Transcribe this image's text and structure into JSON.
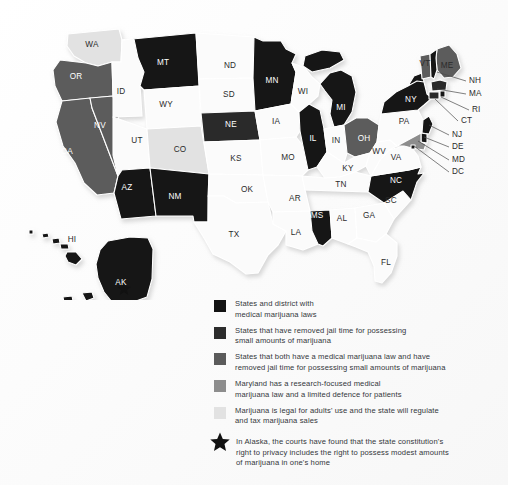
{
  "figure": {
    "background_color": "#fdfdfd",
    "title": ""
  },
  "map": {
    "name": "united-states-marijuana-laws-map",
    "projection_note": "Alaska and Hawaii shown as insets at lower left",
    "colors": {
      "medical_only": "#131313",
      "decriminalized": "#2c2c2c",
      "both_medical_and_decriminalized": "#5b5b5b",
      "maryland_research": "#8d8d8d",
      "legal_regulated": "#e2e2e2",
      "no_category": "#fbfbfb",
      "border": "#ffffff",
      "star": "#111111"
    },
    "states": [
      {
        "abbr": "WA",
        "name": "Washington",
        "category": "legal_regulated",
        "x": 92,
        "y": 45,
        "label_fill": "light"
      },
      {
        "abbr": "OR",
        "name": "Oregon",
        "category": "both_medical_and_decriminalized",
        "x": 76,
        "y": 77,
        "label_fill": "dark"
      },
      {
        "abbr": "CA",
        "name": "California",
        "category": "both_medical_and_decriminalized",
        "x": 67,
        "y": 152,
        "label_fill": "dark"
      },
      {
        "abbr": "NV",
        "name": "Nevada",
        "category": "both_medical_and_decriminalized",
        "x": 100,
        "y": 126,
        "label_fill": "dark"
      },
      {
        "abbr": "ID",
        "name": "Idaho",
        "category": "no_category",
        "x": 121,
        "y": 92,
        "label_fill": "light"
      },
      {
        "abbr": "MT",
        "name": "Montana",
        "category": "medical_only",
        "x": 163,
        "y": 63,
        "label_fill": "dark"
      },
      {
        "abbr": "WY",
        "name": "Wyoming",
        "category": "no_category",
        "x": 166,
        "y": 105,
        "label_fill": "light"
      },
      {
        "abbr": "UT",
        "name": "Utah",
        "category": "no_category",
        "x": 137,
        "y": 141,
        "label_fill": "light"
      },
      {
        "abbr": "CO",
        "name": "Colorado",
        "category": "legal_regulated",
        "x": 180,
        "y": 150,
        "label_fill": "light"
      },
      {
        "abbr": "AZ",
        "name": "Arizona",
        "category": "medical_only",
        "x": 127,
        "y": 188,
        "label_fill": "dark"
      },
      {
        "abbr": "NM",
        "name": "New Mexico",
        "category": "medical_only",
        "x": 175,
        "y": 197,
        "label_fill": "dark"
      },
      {
        "abbr": "ND",
        "name": "North Dakota",
        "category": "no_category",
        "x": 230,
        "y": 66,
        "label_fill": "light"
      },
      {
        "abbr": "SD",
        "name": "South Dakota",
        "category": "no_category",
        "x": 229,
        "y": 95,
        "label_fill": "light"
      },
      {
        "abbr": "NE",
        "name": "Nebraska",
        "category": "decriminalized",
        "x": 231,
        "y": 125,
        "label_fill": "dark"
      },
      {
        "abbr": "KS",
        "name": "Kansas",
        "category": "no_category",
        "x": 236,
        "y": 159,
        "label_fill": "light"
      },
      {
        "abbr": "OK",
        "name": "Oklahoma",
        "category": "no_category",
        "x": 247,
        "y": 190,
        "label_fill": "light"
      },
      {
        "abbr": "TX",
        "name": "Texas",
        "category": "no_category",
        "x": 234,
        "y": 235,
        "label_fill": "light"
      },
      {
        "abbr": "MN",
        "name": "Minnesota",
        "category": "medical_only",
        "x": 272,
        "y": 81,
        "label_fill": "dark"
      },
      {
        "abbr": "IA",
        "name": "Iowa",
        "category": "no_category",
        "x": 276,
        "y": 122,
        "label_fill": "light"
      },
      {
        "abbr": "MO",
        "name": "Missouri",
        "category": "no_category",
        "x": 288,
        "y": 158,
        "label_fill": "light"
      },
      {
        "abbr": "AR",
        "name": "Arkansas",
        "category": "no_category",
        "x": 295,
        "y": 199,
        "label_fill": "light"
      },
      {
        "abbr": "LA",
        "name": "Louisiana",
        "category": "no_category",
        "x": 296,
        "y": 233,
        "label_fill": "light"
      },
      {
        "abbr": "WI",
        "name": "Wisconsin",
        "category": "no_category",
        "x": 303,
        "y": 92,
        "label_fill": "light"
      },
      {
        "abbr": "IL",
        "name": "Illinois",
        "category": "medical_only",
        "x": 313,
        "y": 139,
        "label_fill": "dark"
      },
      {
        "abbr": "MS",
        "name": "Mississippi",
        "category": "medical_only",
        "x": 317,
        "y": 216,
        "label_fill": "dark"
      },
      {
        "abbr": "MI",
        "name": "Michigan",
        "category": "medical_only",
        "x": 341,
        "y": 108,
        "label_fill": "dark"
      },
      {
        "abbr": "IN",
        "name": "Indiana",
        "category": "no_category",
        "x": 336,
        "y": 141,
        "label_fill": "light"
      },
      {
        "abbr": "KY",
        "name": "Kentucky",
        "category": "no_category",
        "x": 348,
        "y": 169,
        "label_fill": "light"
      },
      {
        "abbr": "TN",
        "name": "Tennessee",
        "category": "no_category",
        "x": 341,
        "y": 185,
        "label_fill": "light"
      },
      {
        "abbr": "AL",
        "name": "Alabama",
        "category": "no_category",
        "x": 342,
        "y": 219,
        "label_fill": "light"
      },
      {
        "abbr": "OH",
        "name": "Ohio",
        "category": "both_medical_and_decriminalized",
        "x": 364,
        "y": 139,
        "label_fill": "dark"
      },
      {
        "abbr": "GA",
        "name": "Georgia",
        "category": "no_category",
        "x": 369,
        "y": 216,
        "label_fill": "light"
      },
      {
        "abbr": "FL",
        "name": "Florida",
        "category": "no_category",
        "x": 386,
        "y": 263,
        "label_fill": "light"
      },
      {
        "abbr": "SC",
        "name": "South Carolina",
        "category": "no_category",
        "x": 391,
        "y": 201,
        "label_fill": "light"
      },
      {
        "abbr": "NC",
        "name": "North Carolina",
        "category": "medical_only",
        "x": 396,
        "y": 181,
        "label_fill": "dark"
      },
      {
        "abbr": "VA",
        "name": "Virginia",
        "category": "no_category",
        "x": 396,
        "y": 158,
        "label_fill": "light"
      },
      {
        "abbr": "WV",
        "name": "West Virginia",
        "category": "no_category",
        "x": 379,
        "y": 152,
        "label_fill": "light"
      },
      {
        "abbr": "PA",
        "name": "Pennsylvania",
        "category": "no_category",
        "x": 404,
        "y": 122,
        "label_fill": "light"
      },
      {
        "abbr": "NY",
        "name": "New York",
        "category": "medical_only",
        "x": 411,
        "y": 100,
        "label_fill": "dark"
      },
      {
        "abbr": "VT",
        "name": "Vermont",
        "category": "both_medical_and_decriminalized",
        "x": 425,
        "y": 64,
        "label_fill": "light"
      },
      {
        "abbr": "ME",
        "name": "Maine",
        "category": "both_medical_and_decriminalized",
        "x": 447,
        "y": 66,
        "label_fill": "light"
      },
      {
        "abbr": "AK",
        "name": "Alaska",
        "category": "medical_only",
        "x": 121,
        "y": 283,
        "label_fill": "dark"
      },
      {
        "abbr": "HI",
        "name": "Hawaii",
        "category": "medical_only",
        "x": 72,
        "y": 240,
        "label_fill": "light"
      }
    ],
    "callouts": [
      {
        "abbr": "NH",
        "name": "New Hampshire",
        "category": "medical_only",
        "label_x": 469,
        "label_y": 81,
        "lx1": 466,
        "ly1": 81,
        "lx2": 437,
        "ly2": 72
      },
      {
        "abbr": "MA",
        "name": "Massachusetts",
        "category": "decriminalized",
        "label_x": 469,
        "label_y": 94,
        "lx1": 466,
        "ly1": 94,
        "lx2": 437,
        "ly2": 89
      },
      {
        "abbr": "RI",
        "name": "Rhode Island",
        "category": "medical_only",
        "label_x": 472,
        "label_y": 110,
        "lx1": 469,
        "ly1": 110,
        "lx2": 441,
        "ly2": 97
      },
      {
        "abbr": "CT",
        "name": "Connecticut",
        "category": "decriminalized",
        "label_x": 461,
        "label_y": 121,
        "lx1": 458,
        "ly1": 121,
        "lx2": 435,
        "ly2": 99
      },
      {
        "abbr": "NJ",
        "name": "New Jersey",
        "category": "medical_only",
        "label_x": 452,
        "label_y": 135,
        "lx1": 449,
        "ly1": 135,
        "lx2": 429,
        "ly2": 125
      },
      {
        "abbr": "DE",
        "name": "Delaware",
        "category": "medical_only",
        "label_x": 452,
        "label_y": 147,
        "lx1": 449,
        "ly1": 147,
        "lx2": 424,
        "ly2": 137
      },
      {
        "abbr": "MD",
        "name": "Maryland",
        "category": "maryland_research",
        "label_x": 452,
        "label_y": 160,
        "lx1": 449,
        "ly1": 160,
        "lx2": 418,
        "ly2": 141
      },
      {
        "abbr": "DC",
        "name": "District of Columbia",
        "category": "medical_only",
        "label_x": 452,
        "label_y": 172,
        "lx1": 449,
        "ly1": 172,
        "lx2": 414,
        "ly2": 146
      }
    ],
    "star_marker": {
      "name": "alaska-privacy-star",
      "x": 124,
      "y": 289
    }
  },
  "legend": {
    "name": "map-legend",
    "items": [
      {
        "swatch_color": "#131313",
        "line1": "States and district with",
        "line2": "medical marijuana laws"
      },
      {
        "swatch_color": "#2c2c2c",
        "line1": "States that have removed jail time for possessing",
        "line2": "small amounts of marijuana"
      },
      {
        "swatch_color": "#5b5b5b",
        "line1": "States that both have a medical marijuana law and have",
        "line2": "removed jail time for possessing small amounts of marijuana"
      },
      {
        "swatch_color": "#8d8d8d",
        "line1": "Maryland has a research-focused medical",
        "line2": "marijuana law and a limited defence for patients"
      },
      {
        "swatch_color": "#e2e2e2",
        "line1": "Marijuana is legal for adults' use and the state will regulate",
        "line2": "and tax marijuana sales"
      }
    ],
    "star_note": {
      "icon": "star-icon",
      "line1": "In Alaska, the courts have found that the state constitution's",
      "line2": "right to privacy includes the right to possess modest amounts",
      "line3": "of marijuana in one's home"
    }
  }
}
